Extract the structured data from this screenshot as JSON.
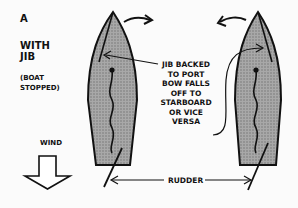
{
  "diagram": {
    "panel_label": "A",
    "heading_line1": "WITH",
    "heading_line2": "JIB",
    "subheading_line1": "(BOAT",
    "subheading_line2": "STOPPED)",
    "wind_label": "WIND",
    "jib_note": [
      "JIB BACKED",
      "TO PORT",
      "BOW FALLS",
      "OFF TO",
      "STARBOARD",
      "OR VICE",
      "VERSA"
    ],
    "rudder_label": "RUDDER",
    "colors": {
      "hull_fill": "#9a9a9a",
      "outline": "#111111",
      "background": "#fbfbfb"
    },
    "icons": [
      "wind-arrow-down-icon",
      "curved-arrow-right-icon",
      "curved-arrow-left-icon"
    ]
  }
}
